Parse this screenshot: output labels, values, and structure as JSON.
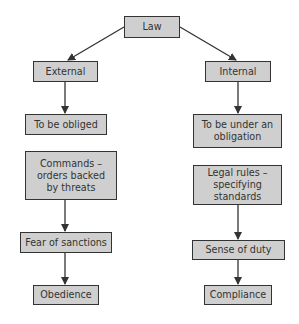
{
  "diagram": {
    "root": {
      "label": "Law"
    },
    "left": {
      "branch": "External",
      "steps": [
        "To be obliged",
        "Commands – orders backed by threats",
        "Fear of sanctions",
        "Obedience"
      ]
    },
    "right": {
      "branch": "Internal",
      "steps": [
        "To be under an obligation",
        "Legal rules – specifying standards",
        "Sense of duty",
        "Compliance"
      ]
    },
    "colors": {
      "box_fill": "#cfcfcf",
      "border": "#333333",
      "text": "#333333"
    }
  }
}
